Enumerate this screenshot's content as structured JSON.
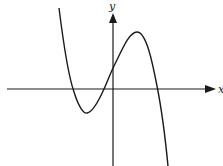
{
  "figure": {
    "type": "function-graph",
    "axes": {
      "x_label": "x",
      "y_label": "y",
      "color": "#1a1a1a"
    },
    "curve": {
      "color": "#1a1a1a",
      "features": {
        "left_x_intercept": "negative",
        "local_minimum": "below x-axis, left of y-axis",
        "middle_x_intercept": "negative, near origin",
        "y_intercept": "positive",
        "local_maximum": "above x-axis, right of y-axis",
        "right_x_intercept": "positive",
        "end_behavior": "rises to the left, falls to the right"
      }
    }
  }
}
